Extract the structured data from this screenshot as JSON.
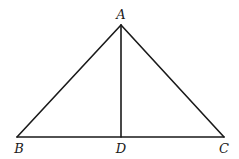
{
  "diagram": {
    "type": "triangle-with-altitude",
    "points": {
      "A": {
        "label": "A",
        "x": 121,
        "y": 25,
        "lx": 121,
        "ly": 19
      },
      "B": {
        "label": "B",
        "x": 17,
        "y": 137,
        "lx": 19,
        "ly": 153
      },
      "D": {
        "label": "D",
        "x": 121,
        "y": 137,
        "lx": 121,
        "ly": 153
      },
      "C": {
        "label": "C",
        "x": 224,
        "y": 137,
        "lx": 224,
        "ly": 153
      }
    },
    "segments": [
      {
        "name": "segment-AB",
        "from": "A",
        "to": "B"
      },
      {
        "name": "segment-AC",
        "from": "A",
        "to": "C"
      },
      {
        "name": "segment-BC",
        "from": "B",
        "to": "C"
      },
      {
        "name": "segment-AD",
        "from": "A",
        "to": "D"
      }
    ],
    "stroke_color": "#1a1a1a",
    "background": "#ffffff"
  }
}
